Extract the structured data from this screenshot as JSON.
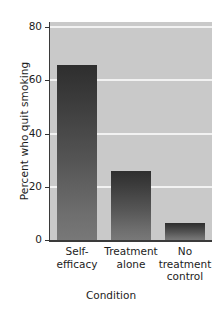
{
  "chart_data": {
    "type": "bar",
    "title": "",
    "subtitle": "",
    "xlabel": "Condition",
    "ylabel": "Percent who quit smoking",
    "categories": [
      "Self-efficacy",
      "Treatment alone",
      "No treatment control"
    ],
    "category_lines": [
      [
        "Self-",
        "efficacy"
      ],
      [
        "Treatment",
        "alone"
      ],
      [
        "No",
        "treatment",
        "control"
      ]
    ],
    "values": [
      66,
      26,
      6.5
    ],
    "ylim": [
      0,
      82
    ],
    "yticks": [
      0,
      20,
      40,
      60,
      80
    ],
    "ytick_labels": [
      "0",
      "20",
      "40",
      "60",
      "80"
    ],
    "gridlines": [
      20,
      40,
      60,
      80
    ],
    "grid": true,
    "legend": "none",
    "colors": {
      "plot_background": "#c9c9c9",
      "figure_background": "#ffffff",
      "gridline": "#f2f2f2",
      "bar_top": "#2e2e2e",
      "bar_bottom": "#787878",
      "axis": "#3a3a3a",
      "text": "#1c1c1c"
    }
  }
}
